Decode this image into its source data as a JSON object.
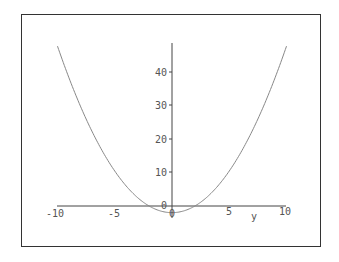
{
  "chart_data": {
    "type": "line",
    "title": "",
    "xlabel": "y",
    "ylabel": "",
    "xlim": [
      -10,
      10
    ],
    "ylim": [
      -2,
      48
    ],
    "x_ticks": [
      -10,
      -5,
      0,
      5,
      10
    ],
    "x_tick_labels": [
      "-10",
      "-5",
      "0",
      "5",
      "10"
    ],
    "y_ticks": [
      0,
      10,
      20,
      30,
      40
    ],
    "y_tick_labels": [
      "0",
      "10",
      "20",
      "30",
      "40"
    ],
    "grid": false,
    "legend": null,
    "series": [
      {
        "name": "curve",
        "expression": "0.5*y^2 - 2",
        "x": [
          -10,
          -8,
          -6,
          -4,
          -2,
          0,
          2,
          4,
          6,
          8,
          10
        ],
        "values": [
          48,
          30,
          16,
          6,
          0,
          -2,
          0,
          6,
          16,
          30,
          48
        ],
        "color": "#888888"
      }
    ]
  },
  "labels": {
    "xlabel": "y",
    "xt0": "-10",
    "xt1": "-5",
    "xt2": "0",
    "xt3": "5",
    "xt4": "10",
    "yt0": "0",
    "yt1": "10",
    "yt2": "20",
    "yt3": "30",
    "yt4": "40"
  }
}
